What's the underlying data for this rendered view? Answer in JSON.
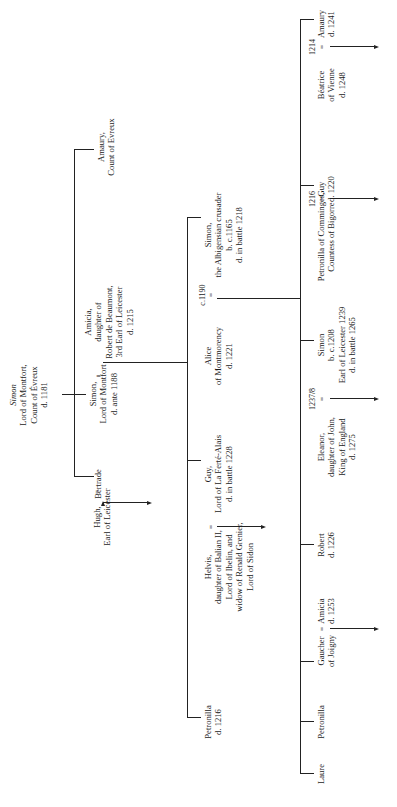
{
  "root": {
    "name": "Simon",
    "lines": [
      "Lord of Montfort,",
      "Count of Évreux",
      "d. 1181"
    ]
  },
  "generation1": [
    {
      "id": "amaury_evreux",
      "lines": [
        "Amaury,",
        "Count of Evreux"
      ]
    },
    {
      "id": "simon_montfort",
      "lines": [
        "Simon,",
        "Lord of Montfort",
        "d. ante 1188"
      ],
      "marriage": {
        "symbol": "=",
        "year": ""
      },
      "spouse": {
        "lines": [
          "Amicia,",
          "daughter of",
          "Robert de Beaumont,",
          "3rd Earl of Leicester",
          "d. 1215"
        ]
      }
    },
    {
      "id": "bertrade",
      "lines": [
        "Bertrade"
      ],
      "marriage": {
        "symbol": "=",
        "year": ""
      },
      "spouse": {
        "lines": [
          "Hugh,",
          "Earl of Leicester"
        ]
      }
    }
  ],
  "generation2": [
    {
      "id": "simon_crusader",
      "lines": [
        "Simon,",
        "the Albigensian crusader",
        "b. c.1165",
        "d. in battle 1218"
      ],
      "marriage": {
        "symbol": "=",
        "year": "c.1190"
      },
      "spouse": {
        "lines": [
          "Alice",
          "of Montmorency",
          "d. 1221"
        ]
      }
    },
    {
      "id": "guy_ferte",
      "lines": [
        "Guy,",
        "Lord of La Ferté-Alais",
        "d. in battle 1228"
      ],
      "marriage": {
        "symbol": "=",
        "year": ""
      },
      "spouse": {
        "lines": [
          "Helvis,",
          "daughter of Balian II,",
          "Lord of Ibelin, and",
          "widow of Renald Grenier,",
          "Lord of Sidon"
        ]
      }
    },
    {
      "id": "petronilla_1216",
      "lines": [
        "Petronilla",
        "d. 1216"
      ]
    }
  ],
  "generation3": [
    {
      "id": "amaury_1241",
      "lines": [
        "Amaury",
        "d. 1241"
      ],
      "marriage": {
        "symbol": "=",
        "year": "1214"
      },
      "spouse": {
        "lines": [
          "Béatrice",
          "of Vienne",
          "d. 1248"
        ]
      }
    },
    {
      "id": "guy_1220",
      "lines": [
        "Guy",
        "d. 1220"
      ],
      "marriage": {
        "symbol": "=",
        "year": "1216"
      },
      "spouse": {
        "lines": [
          "Petronilla of Comminges,",
          "Countess of Bigorre"
        ]
      }
    },
    {
      "id": "simon_leicester",
      "lines": [
        "Simon",
        "b. c.1208",
        "Earl of Leicester 1239",
        "d. in battle 1265"
      ],
      "marriage": {
        "symbol": "=",
        "year": "1237/8"
      },
      "spouse": {
        "lines": [
          "Eleanor,",
          "daughter of John,",
          "King of England",
          "d. 1275"
        ]
      }
    },
    {
      "id": "robert_1226",
      "lines": [
        "Robert",
        "d. 1226"
      ]
    },
    {
      "id": "amicia_1253",
      "lines": [
        "Amicia",
        "d. 1253"
      ],
      "marriage": {
        "symbol": "=",
        "year": ""
      },
      "spouse": {
        "lines": [
          "Gaucher",
          "of Joigny"
        ]
      }
    },
    {
      "id": "petronilla",
      "lines": [
        "Petronilla"
      ]
    },
    {
      "id": "laure",
      "lines": [
        "Laure"
      ]
    }
  ]
}
